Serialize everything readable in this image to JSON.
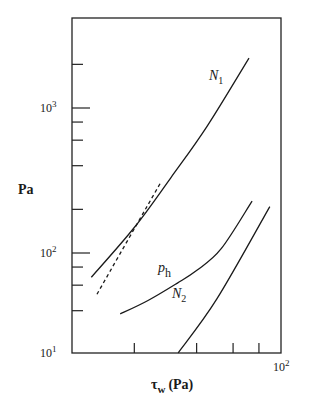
{
  "chart_data": {
    "type": "line",
    "title": "",
    "xlabel": "τw (Pa)",
    "xlabel_main": "τ",
    "xlabel_sub": "w",
    "xlabel_unit": "(Pa)",
    "ylabel": "Pa",
    "xscale": "log",
    "yscale": "log",
    "xlim": [
      10,
      100
    ],
    "ylim": [
      20,
      3000
    ],
    "grid": false,
    "legend": "none (inline curve labels)",
    "x_ticks": [
      20,
      40,
      60,
      80,
      100
    ],
    "x_tick_labels": [
      {
        "value": 100,
        "base": "10",
        "exp": "2"
      }
    ],
    "y_ticks": [
      20,
      40,
      60,
      80,
      100,
      200,
      400,
      600,
      800,
      1000,
      2000
    ],
    "y_tick_labels": [
      {
        "value": 20,
        "base": "10",
        "exp": "1"
      },
      {
        "value": 100,
        "base": "10",
        "exp": "2"
      },
      {
        "value": 1000,
        "base": "10",
        "exp": "3"
      }
    ],
    "series": [
      {
        "name": "N1",
        "label_main": "N",
        "label_sub": "1",
        "style": "solid",
        "x": [
          12.4,
          20,
          30,
          45,
          71.6
        ],
        "y": [
          68,
          150,
          330,
          750,
          2210
        ]
      },
      {
        "name": "N1 (dashed)",
        "label_main": "",
        "label_sub": "",
        "style": "dashed",
        "x": [
          13.2,
          26.9
        ],
        "y": [
          52,
          309
        ]
      },
      {
        "name": "ph",
        "label_main": "p",
        "label_sub": "h",
        "style": "solid",
        "x": [
          17.1,
          23.3,
          32.3,
          40.1,
          52.6,
          74.1
        ],
        "y": [
          38,
          47,
          62,
          76,
          107,
          228
        ]
      },
      {
        "name": "N2",
        "label_main": "N",
        "label_sub": "2",
        "style": "solid",
        "x": [
          32.6,
          50,
          90.3
        ],
        "y": [
          20.5,
          48,
          209
        ]
      }
    ]
  }
}
